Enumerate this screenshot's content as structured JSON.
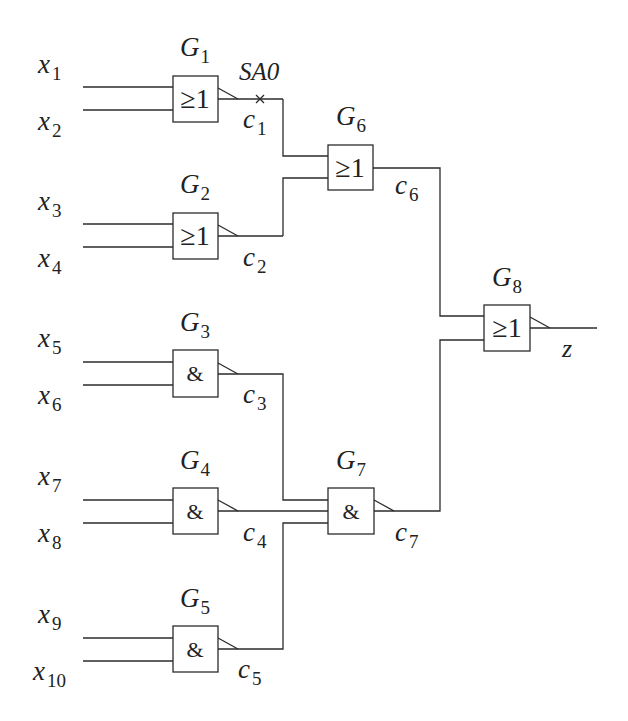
{
  "diagram": {
    "type": "logic-circuit",
    "stroke_color": "#2b2b2b",
    "background": "#ffffff",
    "fault": {
      "label": "SA0",
      "location": "c1",
      "marker": "cross"
    },
    "output": {
      "label": "z"
    },
    "inputs": [
      {
        "id": "x1",
        "base": "x",
        "sub": "1"
      },
      {
        "id": "x2",
        "base": "x",
        "sub": "2"
      },
      {
        "id": "x3",
        "base": "x",
        "sub": "3"
      },
      {
        "id": "x4",
        "base": "x",
        "sub": "4"
      },
      {
        "id": "x5",
        "base": "x",
        "sub": "5"
      },
      {
        "id": "x6",
        "base": "x",
        "sub": "6"
      },
      {
        "id": "x7",
        "base": "x",
        "sub": "7"
      },
      {
        "id": "x8",
        "base": "x",
        "sub": "8"
      },
      {
        "id": "x9",
        "base": "x",
        "sub": "9"
      },
      {
        "id": "x10",
        "base": "x",
        "sub": "10"
      }
    ],
    "gates": [
      {
        "id": "G1",
        "base": "G",
        "sub": "1",
        "symbol": "≥1",
        "type": "NOR",
        "inputs": [
          "x1",
          "x2"
        ],
        "output": "c1"
      },
      {
        "id": "G2",
        "base": "G",
        "sub": "2",
        "symbol": "≥1",
        "type": "NOR",
        "inputs": [
          "x3",
          "x4"
        ],
        "output": "c2"
      },
      {
        "id": "G3",
        "base": "G",
        "sub": "3",
        "symbol": "&",
        "type": "NAND",
        "inputs": [
          "x5",
          "x6"
        ],
        "output": "c3"
      },
      {
        "id": "G4",
        "base": "G",
        "sub": "4",
        "symbol": "&",
        "type": "NAND",
        "inputs": [
          "x7",
          "x8"
        ],
        "output": "c4"
      },
      {
        "id": "G5",
        "base": "G",
        "sub": "5",
        "symbol": "&",
        "type": "NAND",
        "inputs": [
          "x9",
          "x10"
        ],
        "output": "c5"
      },
      {
        "id": "G6",
        "base": "G",
        "sub": "6",
        "symbol": "≥1",
        "type": "OR",
        "inputs": [
          "c1",
          "c2"
        ],
        "output": "c6"
      },
      {
        "id": "G7",
        "base": "G",
        "sub": "7",
        "symbol": "&",
        "type": "NAND",
        "inputs": [
          "c3",
          "c4",
          "c5"
        ],
        "output": "c7"
      },
      {
        "id": "G8",
        "base": "G",
        "sub": "8",
        "symbol": "≥1",
        "type": "NOR",
        "inputs": [
          "c6",
          "c7"
        ],
        "output": "z"
      }
    ],
    "signals": [
      {
        "id": "c1",
        "base": "c",
        "sub": "1"
      },
      {
        "id": "c2",
        "base": "c",
        "sub": "2"
      },
      {
        "id": "c3",
        "base": "c",
        "sub": "3"
      },
      {
        "id": "c4",
        "base": "c",
        "sub": "4"
      },
      {
        "id": "c5",
        "base": "c",
        "sub": "5"
      },
      {
        "id": "c6",
        "base": "c",
        "sub": "6"
      },
      {
        "id": "c7",
        "base": "c",
        "sub": "7"
      }
    ]
  }
}
